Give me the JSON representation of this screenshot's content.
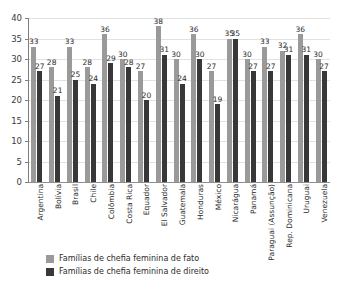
{
  "chart_data": {
    "type": "bar",
    "title": "",
    "xlabel": "",
    "ylabel": "",
    "ylim": [
      0,
      40
    ],
    "ytick_step": 5,
    "yticks": [
      "0",
      "5",
      "10",
      "15",
      "20",
      "25",
      "30",
      "35",
      "40"
    ],
    "grid": true,
    "legend_position": "bottom-left",
    "categories": [
      "Argentina",
      "Bolívia",
      "Brasil",
      "Chile",
      "Colômbia",
      "Costa Rica",
      "Equador",
      "El Salvador",
      "Guatemala",
      "Honduras",
      "México",
      "Nicarágua",
      "Panamá",
      "Paraguai (Assunção)",
      "Rep. Dominicana",
      "Uruguai",
      "Venezuela"
    ],
    "series": [
      {
        "name": "Famílias de chefia feminina de fato",
        "color": "#9a9a9a",
        "values": [
          33,
          28,
          33,
          28,
          36,
          30,
          27,
          38,
          30,
          36,
          27,
          35,
          30,
          33,
          32,
          36,
          30
        ]
      },
      {
        "name": "Famílias de chefia feminina de direito",
        "color": "#383838",
        "values": [
          27,
          21,
          25,
          24,
          29,
          28,
          20,
          31,
          24,
          30,
          19,
          35,
          27,
          27,
          31,
          31,
          27
        ]
      }
    ]
  },
  "legend": {
    "items": [
      {
        "label": "Famílias de chefia feminina de fato"
      },
      {
        "label": "Famílias de chefia feminina de direito"
      }
    ]
  }
}
